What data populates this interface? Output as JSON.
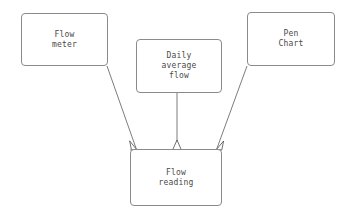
{
  "diagram": {
    "type": "flow-diagram",
    "background_color": "#ffffff",
    "line_color": "#6e6e6e",
    "box_border_color": "#8a8a8a",
    "text_color": "#4a4a4a",
    "nodes": [
      {
        "id": "flow-meter",
        "label": "Flow\nmeter",
        "lines": [
          "Flow",
          "meter"
        ],
        "x": 21,
        "y": 13,
        "width": 87,
        "height": 53
      },
      {
        "id": "daily-average-flow",
        "label": "Daily\naverage\nflow",
        "lines": [
          "Daily",
          "average",
          "flow"
        ],
        "x": 136,
        "y": 39,
        "width": 86,
        "height": 54
      },
      {
        "id": "pen-chart",
        "label": "Pen\nChart",
        "lines": [
          "Pen",
          "Chart"
        ],
        "x": 247,
        "y": 12,
        "width": 88,
        "height": 54
      },
      {
        "id": "flow-reading",
        "label": "Flow\nreading",
        "lines": [
          "Flow",
          "reading"
        ],
        "x": 130,
        "y": 149,
        "width": 92,
        "height": 57
      }
    ],
    "edges": [
      {
        "id": "flow-meter-to-flow-reading",
        "from": "flow-meter",
        "to": "flow-reading",
        "arrowhead": "open-triangle",
        "x1": 107,
        "y1": 66,
        "x2": 136,
        "y2": 149
      },
      {
        "id": "daily-average-flow-to-flow-reading",
        "from": "daily-average-flow",
        "to": "flow-reading",
        "arrowhead": "open-triangle",
        "x1": 177,
        "y1": 93,
        "x2": 177,
        "y2": 149
      },
      {
        "id": "pen-chart-to-flow-reading",
        "from": "pen-chart",
        "to": "flow-reading",
        "arrowhead": "open-triangle",
        "x1": 247,
        "y1": 66,
        "x2": 217,
        "y2": 149
      }
    ]
  }
}
